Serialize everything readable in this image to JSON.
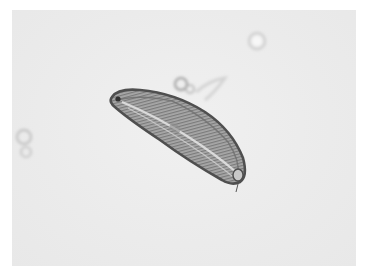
{
  "image": {
    "kind": "light-micrograph",
    "subject": "diatom",
    "colors": {
      "background": "#ececec",
      "border": "#ffffff",
      "cell_outline": "#555555",
      "cell_fill": "#a9a9a9",
      "raphe_highlight": "#e0e0e0"
    },
    "objects": [
      {
        "name": "diatom-cell",
        "shape": "curved-lanceolate",
        "center": [
          178,
          135
        ],
        "length": 150,
        "width": 42,
        "angle_deg": 33
      },
      {
        "name": "bubble-top-right",
        "center": [
          257,
          41
        ],
        "r": 8
      },
      {
        "name": "debris-center",
        "center": [
          185,
          86
        ],
        "r": 9
      },
      {
        "name": "debris-left",
        "center": [
          24,
          143
        ],
        "r": 11
      }
    ]
  }
}
